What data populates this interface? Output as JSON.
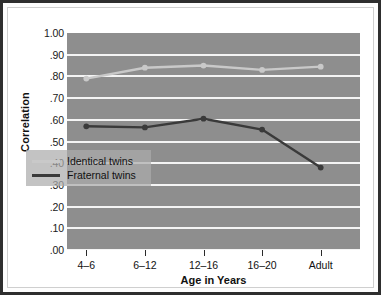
{
  "chart_data": {
    "type": "line",
    "title": "",
    "xlabel": "Age in Years",
    "ylabel": "Correlation",
    "categories": [
      "4–6",
      "6–12",
      "12–16",
      "16–20",
      "Adult"
    ],
    "ylim": [
      0.0,
      1.0
    ],
    "ytick_labels": [
      "1.00",
      ".90",
      ".80",
      ".70",
      ".60",
      ".50",
      ".40",
      ".30",
      ".20",
      ".10",
      ".00"
    ],
    "ytick_values": [
      1.0,
      0.9,
      0.8,
      0.7,
      0.6,
      0.5,
      0.4,
      0.3,
      0.2,
      0.1,
      0.0
    ],
    "grid": true,
    "legend_position": "lower-left-inside",
    "series": [
      {
        "name": "Identical twins",
        "color": "#c9c9c9",
        "values": [
          0.79,
          0.84,
          0.85,
          0.83,
          0.845
        ]
      },
      {
        "name": "Fraternal twins",
        "color": "#3a3a3a",
        "values": [
          0.57,
          0.565,
          0.605,
          0.555,
          0.38
        ]
      }
    ]
  },
  "colors": {
    "plot_background": "#8e8e8e",
    "gridline": "#f4f4f4",
    "frame_border": "#2e2e2e",
    "page_background": "#ffffff",
    "legend_background": "#acacac",
    "identical": "#c9c9c9",
    "fraternal": "#3a3a3a"
  },
  "legend": {
    "items": [
      {
        "label": "Identical twins"
      },
      {
        "label": "Fraternal twins"
      }
    ]
  },
  "axes": {
    "y_title": "Correlation",
    "x_title": "Age in Years"
  }
}
